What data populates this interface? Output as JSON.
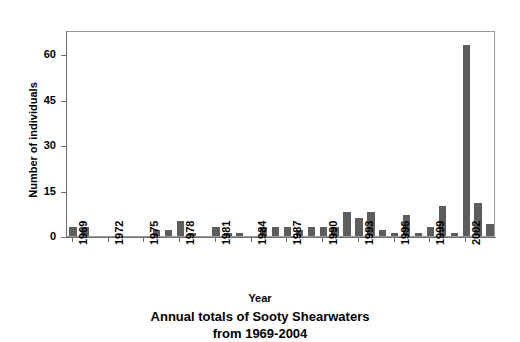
{
  "chart_data": {
    "type": "bar",
    "title": "Annual totals of Sooty Shearwaters from 1969-2004",
    "title_line1": "Annual totals of Sooty Shearwaters",
    "title_line2": "from 1969-2004",
    "xlabel": "Year",
    "ylabel": "Number of individuals",
    "ylim": [
      0,
      68
    ],
    "ytick_values": [
      0,
      15,
      30,
      45,
      60
    ],
    "ytick_labels": [
      "0",
      "15",
      "30",
      "45",
      "60"
    ],
    "xtick_labels": [
      "1969",
      "1972",
      "1975",
      "1978",
      "1981",
      "1984",
      "1987",
      "1990",
      "1993",
      "1996",
      "1999",
      "2002"
    ],
    "grid": false,
    "legend": null,
    "bar_color": "#5d5d5d",
    "axis_color": "#6e6e6e",
    "categories": [
      "1969",
      "1970",
      "1971",
      "1972",
      "1973",
      "1974",
      "1975",
      "1976",
      "1977",
      "1978",
      "1979",
      "1980",
      "1981",
      "1982",
      "1983",
      "1984",
      "1985",
      "1986",
      "1987",
      "1988",
      "1989",
      "1990",
      "1991",
      "1992",
      "1993",
      "1994",
      "1995",
      "1996",
      "1997",
      "1998",
      "1999",
      "2000",
      "2001",
      "2002",
      "2003",
      "2004"
    ],
    "values": [
      3,
      3,
      0,
      0,
      0,
      0,
      0,
      2,
      2,
      5,
      1,
      0,
      3,
      1,
      1,
      0,
      3,
      3,
      3,
      2,
      3,
      3,
      3,
      8,
      6,
      8,
      2,
      1,
      7,
      1,
      3,
      10,
      1,
      63,
      11,
      4
    ]
  }
}
